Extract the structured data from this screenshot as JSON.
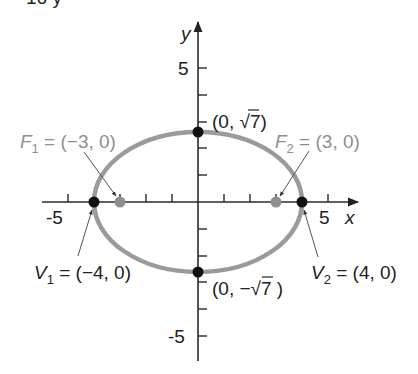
{
  "header_fragment": "16      y",
  "axes": {
    "x_label": "x",
    "y_label": "y",
    "x_ticks": [
      "-5",
      "5"
    ],
    "y_ticks": [
      "5",
      "-5"
    ],
    "x_range": [
      -5.9,
      6.1
    ],
    "y_range": [
      -6.1,
      6.5
    ]
  },
  "ellipse": {
    "equation_hint": "x^2/16 + y^2/7 = 1",
    "a": 4,
    "b": 2.6458,
    "color": "#9a9a9a"
  },
  "points": {
    "v1": {
      "name": "V",
      "sub": "1",
      "text": " = (−4, 0)",
      "x": -4,
      "y": 0,
      "color": "#111111"
    },
    "v2": {
      "name": "V",
      "sub": "2",
      "text": " = (4, 0)",
      "x": 4,
      "y": 0,
      "color": "#111111"
    },
    "f1": {
      "name": "F",
      "sub": "1",
      "text": " = (−3, 0)",
      "x": -3,
      "y": 0,
      "color": "#8f8f8f"
    },
    "f2": {
      "name": "F",
      "sub": "2",
      "text": " = (3, 0)",
      "x": 3,
      "y": 0,
      "color": "#8f8f8f"
    },
    "top": {
      "text_a": "(0, ",
      "sqrt": "√",
      "radicand": "7",
      "text_b": ")",
      "x": 0,
      "y": 2.6458,
      "color": "#111111"
    },
    "bottom": {
      "text_a": "(0, −",
      "sqrt": "√",
      "radicand": "7",
      "text_b": " )",
      "x": 0,
      "y": -2.6458,
      "color": "#111111"
    }
  }
}
